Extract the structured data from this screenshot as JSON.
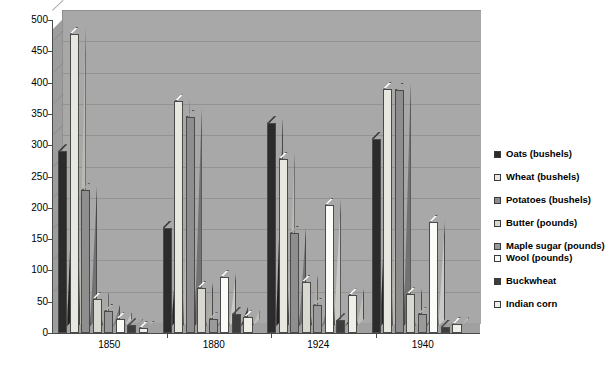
{
  "chart_data": {
    "type": "bar",
    "title": "",
    "subtitle": "",
    "xlabel": "",
    "ylabel": "",
    "ylim": [
      0,
      500
    ],
    "ytick_step": 50,
    "yticks": [
      "500",
      "450",
      "400",
      "350",
      "300",
      "250",
      "200",
      "150",
      "100",
      "50",
      "0"
    ],
    "grid": true,
    "legend_position": "right",
    "style": "3d-column",
    "categories": [
      "1850",
      "1880",
      "1924",
      "1940"
    ],
    "series": [
      {
        "name": "Oats (bushels)",
        "color": "#2b2b2b",
        "values": [
          290,
          168,
          335,
          310
        ]
      },
      {
        "name": "Wheat (bushels)",
        "color": "#e8e8e0",
        "values": [
          478,
          370,
          278,
          390
        ]
      },
      {
        "name": "Potatoes (bushels)",
        "color": "#8e8e8e",
        "values": [
          228,
          345,
          160,
          388
        ]
      },
      {
        "name": "Butter (pounds)",
        "color": "#d8d8d0",
        "values": [
          55,
          72,
          82,
          62
        ]
      },
      {
        "name": "Maple sugar (pounds)",
        "color": "#9a9a9a",
        "values": [
          35,
          22,
          45,
          30
        ]
      },
      {
        "name": "Wool (pounds)",
        "color": "#fbfbf7",
        "values": [
          22,
          90,
          205,
          178
        ]
      },
      {
        "name": "Buckwheat",
        "color": "#3d3d3d",
        "values": [
          12,
          30,
          20,
          10
        ]
      },
      {
        "name": "Indian corn",
        "color": "#efefe8",
        "values": [
          8,
          25,
          60,
          15
        ]
      }
    ]
  },
  "legend": {
    "items": [
      {
        "label": "Oats (bushels)"
      },
      {
        "label": "Wheat (bushels)"
      },
      {
        "label": "Potatoes (bushels)"
      },
      {
        "label": "Butter (pounds)"
      },
      {
        "label": "Maple sugar (pounds)"
      },
      {
        "label": "Wool (pounds)"
      },
      {
        "label": "Buckwheat"
      },
      {
        "label": "Indian corn"
      }
    ]
  },
  "colors": {
    "plot_background": "#a8a8a8",
    "floor": "#a0a0a0",
    "left_wall": "#9d9d9d",
    "gridline": "#8c8c8c",
    "axis": "#4a4a4a",
    "page_background": "#ffffff",
    "text": "#000000"
  }
}
